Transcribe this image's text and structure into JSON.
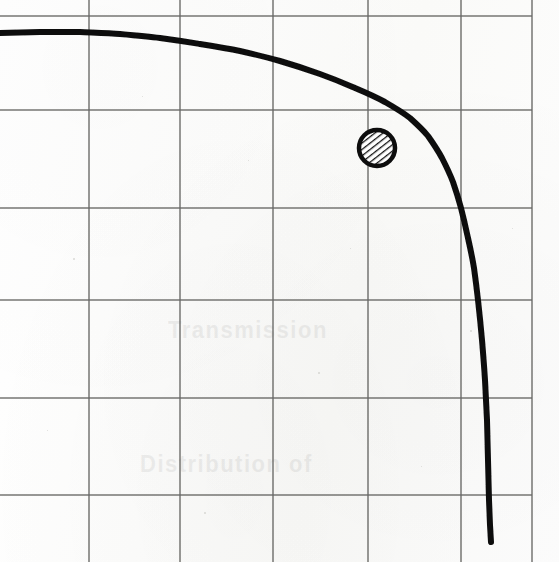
{
  "figure": {
    "kind": "scanned-hand-drawn-graph",
    "width": 559,
    "height": 562,
    "background_color": "#fdfdfc",
    "ink_color": "#111111",
    "grid_color": "#6a6a68",
    "caption": ""
  },
  "ghost_text": [
    {
      "text": "Transmission",
      "x": 168,
      "y": 318,
      "size": 22
    },
    {
      "text": "Distribution of",
      "x": 140,
      "y": 452,
      "size": 22
    }
  ],
  "chart_data": {
    "type": "line",
    "title": "",
    "subtitle": "",
    "xlabel": "",
    "ylabel": "",
    "grid": true,
    "legend": null,
    "annotations": [],
    "axis_ranges": {
      "xlim": [
        0,
        1
      ],
      "ylim": [
        0,
        1
      ]
    },
    "grid_lines": {
      "vertical_px": [
        89,
        180,
        273,
        368,
        461,
        532
      ],
      "horizontal_px": [
        16,
        110,
        208,
        300,
        398,
        495
      ],
      "plot_left_px": 0,
      "plot_right_px": 532,
      "plot_top_px": 16,
      "plot_bottom_px": 542
    },
    "axes_lines": {
      "bottom_axis_y_px": 542,
      "bottom_axis_weight": "thick"
    },
    "series": [
      {
        "name": "decay-curve",
        "style": "thick-hand-drawn",
        "stroke": "#111111",
        "stroke_width_px": 6,
        "points_px": [
          [
            0,
            33
          ],
          [
            40,
            32
          ],
          [
            80,
            32
          ],
          [
            120,
            34
          ],
          [
            160,
            38
          ],
          [
            200,
            44
          ],
          [
            240,
            51
          ],
          [
            280,
            61
          ],
          [
            320,
            74
          ],
          [
            355,
            88
          ],
          [
            385,
            102
          ],
          [
            410,
            118
          ],
          [
            428,
            136
          ],
          [
            442,
            158
          ],
          [
            453,
            182
          ],
          [
            461,
            208
          ],
          [
            468,
            238
          ],
          [
            474,
            268
          ],
          [
            478,
            300
          ],
          [
            482,
            340
          ],
          [
            485,
            380
          ],
          [
            487,
            420
          ],
          [
            488,
            460
          ],
          [
            489,
            500
          ],
          [
            490,
            525
          ],
          [
            491,
            542
          ]
        ]
      }
    ],
    "markers": [
      {
        "name": "hatched-data-point",
        "shape": "circle",
        "fill": "diagonal-hatch",
        "outline": "#111111",
        "center_px": [
          377,
          148
        ],
        "radius_px": 20
      }
    ]
  },
  "specks": [
    {
      "x": 73,
      "y": 258,
      "size": 2
    },
    {
      "x": 142,
      "y": 96,
      "size": 1
    },
    {
      "x": 318,
      "y": 372,
      "size": 2
    },
    {
      "x": 421,
      "y": 466,
      "size": 1
    },
    {
      "x": 204,
      "y": 512,
      "size": 2
    },
    {
      "x": 512,
      "y": 228,
      "size": 1
    },
    {
      "x": 47,
      "y": 430,
      "size": 1
    },
    {
      "x": 350,
      "y": 248,
      "size": 1
    },
    {
      "x": 248,
      "y": 160,
      "size": 1
    },
    {
      "x": 470,
      "y": 330,
      "size": 2
    }
  ]
}
